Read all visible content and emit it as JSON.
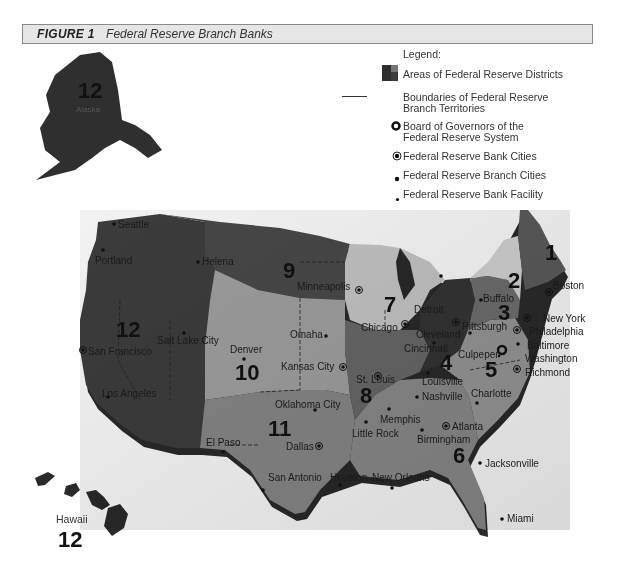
{
  "figure": {
    "number_label": "FIGURE 1",
    "caption": "Federal Reserve Branch Banks"
  },
  "legend": {
    "title": "Legend:",
    "items": [
      {
        "symbol": "district-area-swatch",
        "label_line1": "Areas of Federal Reserve Districts",
        "label_line2": ""
      },
      {
        "symbol": "boundary-line",
        "label_line1": "Boundaries of Federal Reserve",
        "label_line2": "Branch Territories"
      },
      {
        "symbol": "board-of-governors-ring",
        "label_line1": "Board of Governors of the",
        "label_line2": "Federal Reserve System"
      },
      {
        "symbol": "bank-city-dot-ring",
        "label_line1": "Federal Reserve Bank Cities",
        "label_line2": ""
      },
      {
        "symbol": "branch-city-dot",
        "label_line1": "Federal Reserve Branch Cities",
        "label_line2": ""
      },
      {
        "symbol": "facility-dot",
        "label_line1": "Federal Reserve Bank Facility",
        "label_line2": ""
      }
    ]
  },
  "districts": [
    {
      "number": "1",
      "name": "Boston"
    },
    {
      "number": "2",
      "name": "New York"
    },
    {
      "number": "3",
      "name": "Philadelphia"
    },
    {
      "number": "4",
      "name": "Cleveland"
    },
    {
      "number": "5",
      "name": "Richmond"
    },
    {
      "number": "6",
      "name": "Atlanta"
    },
    {
      "number": "7",
      "name": "Chicago"
    },
    {
      "number": "8",
      "name": "St. Louis"
    },
    {
      "number": "9",
      "name": "Minneapolis"
    },
    {
      "number": "10",
      "name": "Kansas City"
    },
    {
      "number": "11",
      "name": "Dallas"
    },
    {
      "number": "12",
      "name": "San Francisco"
    }
  ],
  "insets": {
    "alaska": {
      "label": "Alaska",
      "district": "12"
    },
    "hawaii": {
      "label": "Hawaii",
      "district": "12"
    }
  },
  "cities": {
    "bank_cities": [
      "Boston",
      "New York",
      "Philadelphia",
      "Cleveland",
      "Richmond",
      "Atlanta",
      "Chicago",
      "St. Louis",
      "Minneapolis",
      "Kansas City",
      "Dallas",
      "San Francisco"
    ],
    "branch_cities": [
      "Seattle",
      "Portland",
      "Helena",
      "Salt Lake City",
      "Los Angeles",
      "Denver",
      "Omaha",
      "Oklahoma City",
      "El Paso",
      "San Antonio",
      "Houston",
      "Little Rock",
      "Memphis",
      "Louisville",
      "Nashville",
      "Birmingham",
      "New Orleans",
      "Jacksonville",
      "Miami",
      "Detroit",
      "Buffalo",
      "Pittsburgh",
      "Cincinnati",
      "Baltimore",
      "Charlotte"
    ],
    "board_of_governors": "Washington",
    "facility": [
      "Culpeper"
    ]
  },
  "labels": {
    "seattle": "Seattle",
    "portland": "Portland",
    "helena": "Helena",
    "san_francisco": "San Francisco",
    "salt_lake_city": "Salt Lake City",
    "los_angeles": "Los Angeles",
    "denver": "Denver",
    "minneapolis": "Minneapolis",
    "omaha": "Omaha",
    "kansas_city": "Kansas City",
    "oklahoma_city": "Oklahoma City",
    "el_paso": "El Paso",
    "dallas": "Dallas",
    "san_antonio": "San Antonio",
    "houston": "Houston",
    "chicago": "Chicago",
    "detroit": "Detroit",
    "st_louis": "St. Louis",
    "little_rock": "Little Rock",
    "memphis": "Memphis",
    "louisville": "Louisville",
    "cincinnati": "Cincinnati",
    "cleveland": "Cleveland",
    "pittsburgh": "Pittsburgh",
    "buffalo": "Buffalo",
    "boston": "Boston",
    "new_york": "New York",
    "philadelphia": "Philadelphia",
    "baltimore": "Baltimore",
    "washington": "Washington",
    "culpeper": "Culpeper",
    "richmond": "Richmond",
    "charlotte": "Charlotte",
    "nashville": "Nashville",
    "atlanta": "Atlanta",
    "birmingham": "Birmingham",
    "new_orleans": "New Orleans",
    "jacksonville": "Jacksonville",
    "miami": "Miami",
    "alaska": "Alaska"
  },
  "colors": {
    "district_dark": "#3a3a3a",
    "district_mid": "#6e6e6e",
    "district_light": "#a8a8a8",
    "district_pale": "#cfcfcf",
    "title_bar_bg": "#e6e6e6",
    "coast_shadow": "#2a2a2a"
  }
}
